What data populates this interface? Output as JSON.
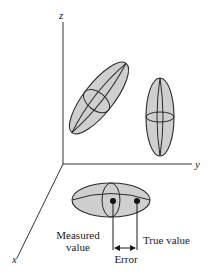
{
  "diagram": {
    "type": "3d-error-ellipsoid-illustration",
    "axes": {
      "z": {
        "label": "z"
      },
      "y": {
        "label": "y"
      },
      "x": {
        "label": "x"
      }
    },
    "ellipsoids": [
      {
        "name": "tilted-ellipsoid",
        "orientation": "diagonal"
      },
      {
        "name": "vertical-ellipsoid",
        "orientation": "vertical"
      },
      {
        "name": "horizontal-ellipsoid",
        "orientation": "horizontal"
      }
    ],
    "annotations": {
      "measured_value_line1": "Measured",
      "measured_value_line2": "value",
      "true_value": "True value",
      "error": "Error"
    },
    "colors": {
      "ellipsoid_fill": "#cfcfcf",
      "stroke": "#2a2a2a",
      "background": "#ffffff"
    }
  }
}
